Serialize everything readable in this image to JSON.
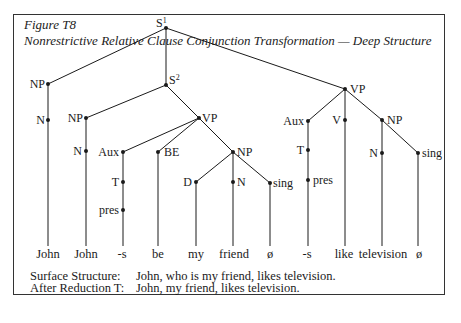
{
  "figure": {
    "number": "Figure T8",
    "title": "Nonrestrictive Relative Clause Conjunction Transformation — Deep Structure"
  },
  "tree": {
    "nodes": {
      "S1": {
        "label": "S",
        "sup": "1"
      },
      "S2": {
        "label": "S",
        "sup": "2"
      },
      "NP_subj": "NP",
      "N_subj": "N",
      "NP_rel": "NP",
      "N_rel": "N",
      "VP_rel": "VP",
      "Aux_rel": "Aux",
      "T_rel": "T",
      "pres_rel": "pres",
      "BE": "BE",
      "NP_pred": "NP",
      "D_pred": "D",
      "N_pred": "N",
      "sing_pred": "sing",
      "VP_main": "VP",
      "Aux_main": "Aux",
      "T_main": "T",
      "pres_main": "pres",
      "V_main": "V",
      "NP_obj": "NP",
      "N_obj": "N",
      "sing_obj": "sing"
    },
    "leaves": [
      "John",
      "John",
      "-s",
      "be",
      "my",
      "friend",
      "ø",
      "-s",
      "like",
      "television",
      "ø"
    ]
  },
  "notes": [
    {
      "key": "Surface Structure:",
      "value": "John, who is my friend, likes television."
    },
    {
      "key": "After Reduction T:",
      "value": "John, my friend, likes television."
    }
  ]
}
